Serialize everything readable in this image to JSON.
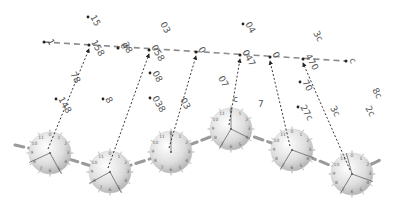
{
  "diagram": {
    "title": "",
    "colors": {
      "top_line": "#8a8a8a",
      "arrow": "#222222",
      "sphere_light": "#ffffff",
      "sphere_dark": "#b8b8b8",
      "sphere_link": "#9a9a9a",
      "label": "#555555",
      "dot": "#222222"
    },
    "top_line": {
      "start": [
        44,
        42
      ],
      "end": [
        346,
        61
      ],
      "start_label": "1",
      "end_label": "c",
      "points": [
        {
          "x": 89,
          "y": 45,
          "label": "158"
        },
        {
          "x": 118,
          "y": 48,
          "label": "0"
        },
        {
          "x": 149,
          "y": 50,
          "label": "058"
        },
        {
          "x": 196,
          "y": 52,
          "label": "0"
        },
        {
          "x": 240,
          "y": 55,
          "label": "047"
        },
        {
          "x": 270,
          "y": 57,
          "label": "0"
        },
        {
          "x": 303,
          "y": 59,
          "label": "470"
        }
      ]
    },
    "scattered_labels": [
      {
        "x": 90,
        "y": 17,
        "text": "15",
        "dot": true,
        "rot": 60
      },
      {
        "x": 160,
        "y": 24,
        "text": "03",
        "dot": false,
        "rot": 60
      },
      {
        "x": 245,
        "y": 24,
        "text": "04",
        "dot": true,
        "rot": 60
      },
      {
        "x": 313,
        "y": 33,
        "text": "3c",
        "dot": false,
        "rot": 60
      },
      {
        "x": 122,
        "y": 44,
        "text": "28",
        "dot": false,
        "rot": 60
      },
      {
        "x": 70,
        "y": 74,
        "text": "78",
        "dot": false,
        "rot": 60
      },
      {
        "x": 152,
        "y": 73,
        "text": "08",
        "dot": true,
        "rot": 60
      },
      {
        "x": 58,
        "y": 99,
        "text": "148",
        "dot": true,
        "rot": 60
      },
      {
        "x": 105,
        "y": 99,
        "text": "8",
        "dot": true,
        "rot": 60
      },
      {
        "x": 152,
        "y": 98,
        "text": "038",
        "dot": true,
        "rot": 60
      },
      {
        "x": 180,
        "y": 100,
        "text": "03",
        "dot": false,
        "rot": 60
      },
      {
        "x": 218,
        "y": 78,
        "text": "07",
        "dot": false,
        "rot": 60
      },
      {
        "x": 302,
        "y": 82,
        "text": "70",
        "dot": true,
        "rot": 60
      },
      {
        "x": 300,
        "y": 107,
        "text": "27c",
        "dot": true,
        "rot": 60
      },
      {
        "x": 330,
        "y": 108,
        "text": "3c",
        "dot": false,
        "rot": 60
      },
      {
        "x": 365,
        "y": 108,
        "text": "2c",
        "dot": false,
        "rot": 60
      },
      {
        "x": 372,
        "y": 90,
        "text": "8c",
        "dot": false,
        "rot": 60
      },
      {
        "x": 258,
        "y": 107,
        "text": "7",
        "dot": false,
        "rot": 0
      },
      {
        "x": 233,
        "y": 102,
        "text": "c",
        "dot": false,
        "rot": 0
      }
    ],
    "spheres": [
      {
        "cx": 50,
        "cy": 153,
        "r": 21,
        "arrow_to": 0,
        "hands": [
          [
            -22,
            10
          ],
          [
            12,
            22
          ]
        ]
      },
      {
        "cx": 110,
        "cy": 172,
        "r": 21,
        "arrow_to": 2,
        "hands": [
          [
            -22,
            12
          ],
          [
            12,
            22
          ]
        ]
      },
      {
        "cx": 171,
        "cy": 152,
        "r": 21,
        "arrow_to": 3,
        "hands": [
          [
            0,
            -22
          ]
        ]
      },
      {
        "cx": 231,
        "cy": 129,
        "r": 21,
        "arrow_to": 4,
        "hands": [
          [
            0,
            -22
          ],
          [
            -12,
            20
          ],
          [
            20,
            10
          ]
        ]
      },
      {
        "cx": 292,
        "cy": 150,
        "r": 21,
        "arrow_to": 5,
        "hands": [
          [
            -12,
            20
          ],
          [
            22,
            8
          ]
        ]
      },
      {
        "cx": 352,
        "cy": 174,
        "r": 21,
        "arrow_to": 6,
        "hands": [
          [
            -12,
            20
          ],
          [
            22,
            8
          ],
          [
            -6,
            -22
          ]
        ]
      }
    ],
    "dial_ticks": [
      "0",
      "1",
      "2",
      "3",
      "4",
      "5",
      "6",
      "7",
      "8",
      "9",
      "10",
      "11"
    ]
  }
}
